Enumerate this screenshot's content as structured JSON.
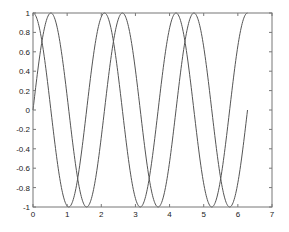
{
  "chart_data": {
    "type": "line",
    "title": "",
    "xlabel": "",
    "ylabel": "",
    "xlim": [
      0,
      7
    ],
    "ylim": [
      -1,
      1
    ],
    "grid": false,
    "legend": null,
    "x_ticks": [
      "0",
      "1",
      "2",
      "3",
      "4",
      "5",
      "6",
      "7"
    ],
    "y_ticks": [
      "1",
      "0.8",
      "0.6",
      "0.4",
      "0.2",
      "0",
      "-0.2",
      "-0.4",
      "-0.6",
      "-0.8",
      "-1"
    ],
    "series": [
      {
        "name": "sin(3x)",
        "function": "sin(3*x)",
        "x_range": [
          0,
          6.2832
        ],
        "color": "#555555"
      },
      {
        "name": "cos(3x)",
        "function": "cos(3*x)",
        "x_range": [
          0,
          6.2832
        ],
        "color": "#555555"
      }
    ],
    "colors": {
      "axes": "#777777",
      "line": "#555555",
      "background": "#ffffff"
    }
  }
}
